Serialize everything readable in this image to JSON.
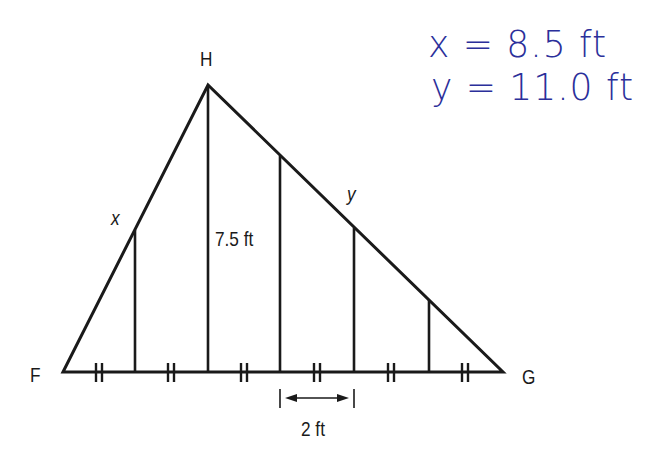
{
  "diagram": {
    "type": "triangle-with-parallel-segments",
    "vertices": {
      "F": "F",
      "G": "G",
      "H": "H"
    },
    "labels": {
      "x": "x",
      "y": "y",
      "height": "7.5 ft",
      "spacing": "2 ft"
    },
    "handwritten": {
      "line1": "x = 8.5 ft",
      "line2": "y = 11.0 ft"
    },
    "congruence_marks": 6,
    "vertical_segments": 5,
    "colors": {
      "ink": "#1a1a1a",
      "handwriting": "#2b2f9a"
    }
  }
}
